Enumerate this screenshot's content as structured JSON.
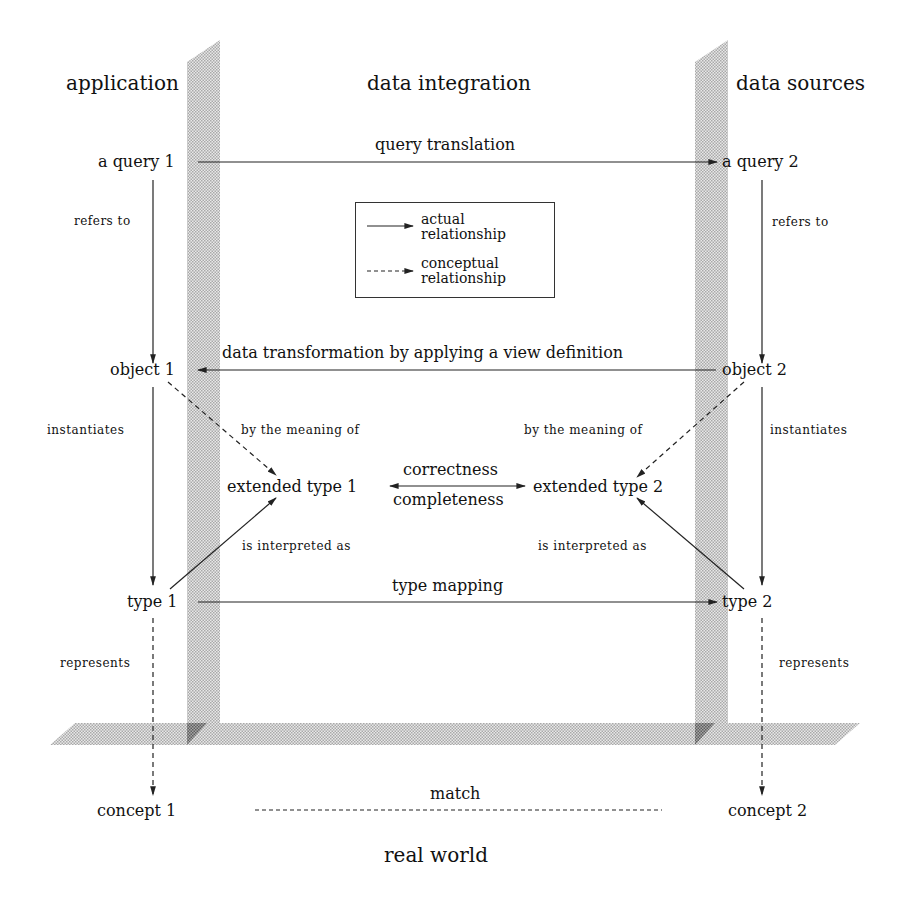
{
  "layers": {
    "application": "application",
    "data_integration": "data integration",
    "data_sources": "data sources",
    "real_world": "real world"
  },
  "nodes": {
    "query1": "a query 1",
    "query2": "a query 2",
    "object1": "object 1",
    "object2": "object 2",
    "ext_type1": "extended type 1",
    "ext_type2": "extended type 2",
    "type1": "type 1",
    "type2": "type 2",
    "concept1": "concept 1",
    "concept2": "concept 2"
  },
  "edges": {
    "query_translation": "query translation",
    "refers_to_left": "refers to",
    "refers_to_right": "refers to",
    "data_transformation": "data transformation by applying a view definition",
    "instantiates_left": "instantiates",
    "instantiates_right": "instantiates",
    "meaning_left": "by the meaning of",
    "meaning_right": "by the meaning of",
    "correctness": "correctness",
    "completeness": "completeness",
    "interpreted_left": "is interpreted as",
    "interpreted_right": "is interpreted as",
    "type_mapping": "type mapping",
    "represents_left": "represents",
    "represents_right": "represents",
    "match": "match"
  },
  "legend": {
    "actual": "actual relationship",
    "conceptual": "conceptual relationship"
  },
  "colors": {
    "ink": "#222222",
    "band": "#c8c8c8",
    "band_dark": "#8a8a8a"
  }
}
